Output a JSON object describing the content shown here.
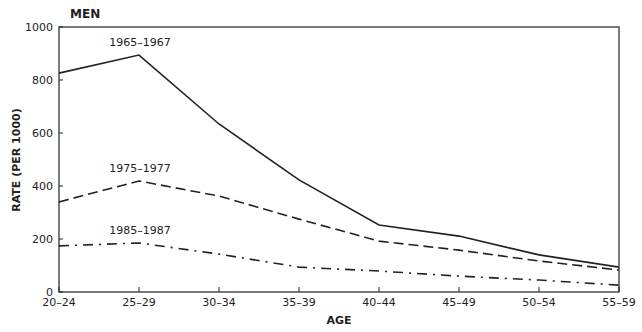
{
  "chart_data": {
    "type": "line",
    "title": "MEN",
    "xlabel": "AGE",
    "ylabel": "RATE (PER 1000)",
    "categories": [
      "20–24",
      "25–29",
      "30–34",
      "35–39",
      "40–44",
      "45–49",
      "50–54",
      "55–59"
    ],
    "yticks": [
      0,
      200,
      400,
      600,
      800,
      1000
    ],
    "ylim": [
      0,
      1000
    ],
    "grid": false,
    "legend": "inline labels",
    "series": [
      {
        "name": "1965–1967",
        "style": "solid",
        "values": [
          826,
          894,
          634,
          423,
          253,
          211,
          140,
          94
        ]
      },
      {
        "name": "1975–1977",
        "style": "dashed",
        "values": [
          340,
          419,
          362,
          275,
          192,
          158,
          117,
          83
        ]
      },
      {
        "name": "1985–1987",
        "style": "dashdot",
        "values": [
          174,
          185,
          143,
          94,
          79,
          60,
          45,
          26
        ]
      }
    ]
  }
}
